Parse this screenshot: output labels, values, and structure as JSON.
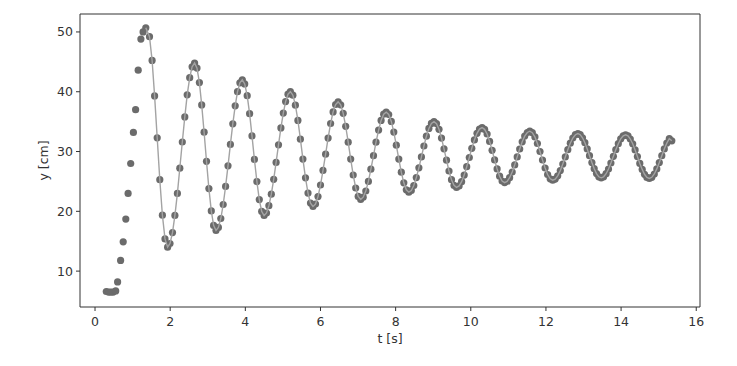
{
  "chart_data": {
    "type": "scatter",
    "title": "",
    "xlabel": "t [s]",
    "ylabel": "y [cm]",
    "xlim": [
      -0.4,
      16.1
    ],
    "ylim": [
      4,
      53
    ],
    "grid": false,
    "legend": null,
    "x_ticks": [
      0,
      2,
      4,
      6,
      8,
      10,
      12,
      14,
      16
    ],
    "y_ticks": [
      10,
      20,
      30,
      40,
      50
    ],
    "colors": {
      "marker": "#6b6b6b",
      "line": "#a3a3a3",
      "axes": "#333333"
    },
    "series": [
      {
        "name": "measured",
        "style": "markers+line",
        "rising_points": [
          {
            "t": 0.3,
            "y": 6.6
          },
          {
            "t": 0.36,
            "y": 6.5
          },
          {
            "t": 0.42,
            "y": 6.5
          },
          {
            "t": 0.48,
            "y": 6.5
          },
          {
            "t": 0.55,
            "y": 6.7
          },
          {
            "t": 0.6,
            "y": 8.2
          },
          {
            "t": 0.68,
            "y": 11.8
          },
          {
            "t": 0.75,
            "y": 14.9
          },
          {
            "t": 0.82,
            "y": 18.7
          },
          {
            "t": 0.88,
            "y": 23.0
          },
          {
            "t": 0.95,
            "y": 28.0
          },
          {
            "t": 1.02,
            "y": 33.2
          },
          {
            "t": 1.08,
            "y": 37.0
          },
          {
            "t": 1.15,
            "y": 43.6
          },
          {
            "t": 1.22,
            "y": 48.8
          },
          {
            "t": 1.28,
            "y": 50.0
          },
          {
            "t": 1.35,
            "y": 50.7
          }
        ],
        "peaks": [
          {
            "t": 1.38,
            "y": 50.6
          },
          {
            "t": 2.65,
            "y": 44.8
          },
          {
            "t": 3.92,
            "y": 42.0
          },
          {
            "t": 5.2,
            "y": 40.0
          },
          {
            "t": 6.47,
            "y": 38.3
          },
          {
            "t": 7.75,
            "y": 36.6
          },
          {
            "t": 9.02,
            "y": 35.0
          },
          {
            "t": 10.3,
            "y": 34.0
          },
          {
            "t": 11.57,
            "y": 33.4
          },
          {
            "t": 12.85,
            "y": 33.0
          },
          {
            "t": 14.12,
            "y": 32.8
          }
        ],
        "troughs": [
          {
            "t": 1.93,
            "y": 14.0
          },
          {
            "t": 3.22,
            "y": 16.8
          },
          {
            "t": 4.5,
            "y": 19.3
          },
          {
            "t": 5.8,
            "y": 20.8
          },
          {
            "t": 7.07,
            "y": 22.0
          },
          {
            "t": 8.35,
            "y": 23.2
          },
          {
            "t": 9.62,
            "y": 24.0
          },
          {
            "t": 10.9,
            "y": 24.8
          },
          {
            "t": 12.18,
            "y": 25.2
          },
          {
            "t": 13.47,
            "y": 25.6
          },
          {
            "t": 14.75,
            "y": 25.5
          }
        ],
        "end_point": {
          "t": 15.35,
          "y": 31.8
        },
        "sample_interval_s": 0.065,
        "equilibrium_cm": 29.5,
        "period_s": 1.275
      }
    ]
  }
}
